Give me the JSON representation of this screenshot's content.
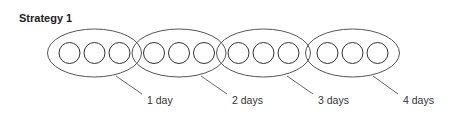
{
  "title": "Strategy 1",
  "groups": [
    {
      "label": "1 day",
      "circles": 3,
      "cx": 94.5,
      "lx1": 116,
      "ly1": 76,
      "lx2": 142,
      "ly2": 94,
      "tx": 147
    },
    {
      "label": "2 days",
      "circles": 3,
      "cx": 179,
      "lx1": 201,
      "ly1": 76,
      "lx2": 227,
      "ly2": 94,
      "tx": 232
    },
    {
      "label": "3 days",
      "circles": 3,
      "cx": 263.5,
      "lx1": 287,
      "ly1": 76,
      "lx2": 313,
      "ly2": 94,
      "tx": 318
    },
    {
      "label": "4 days",
      "circles": 3,
      "cx": 352.5,
      "lx1": 373,
      "ly1": 76,
      "lx2": 398,
      "ly2": 94,
      "tx": 403
    }
  ],
  "colors": {
    "stroke": "#555555",
    "text": "#333333"
  }
}
